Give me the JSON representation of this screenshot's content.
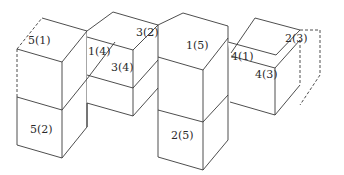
{
  "diagram": {
    "stroke_color": "#3a3a3a",
    "background": "#ffffff",
    "labels": {
      "c51": "5(1)",
      "c52": "5(2)",
      "c14": "1(4)",
      "c32": "3(2)",
      "c34": "3(4)",
      "c15": "1(5)",
      "c25": "2(5)",
      "c41": "4(1)",
      "c43": "4(3)",
      "c23": "2(3)"
    }
  }
}
